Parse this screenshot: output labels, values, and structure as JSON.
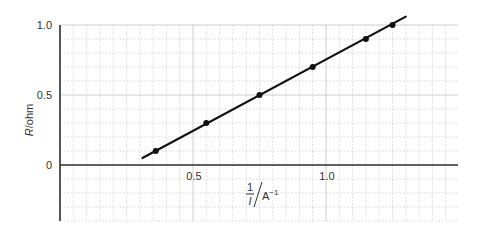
{
  "chart_data": {
    "type": "line",
    "title": "",
    "xlabel": "1/I / A^-1",
    "ylabel": "R/ohm",
    "xlabel_parts": {
      "numerator": "1",
      "denominator": "I",
      "unit": "A",
      "unit_exp": "−1"
    },
    "ylabel_parts": {
      "symbol": "R",
      "unit": "/ohm"
    },
    "xlim": [
      0,
      1.5
    ],
    "ylim": [
      -0.4,
      1.0
    ],
    "x_ticks": [
      {
        "value": 0.5,
        "label": "0.5"
      },
      {
        "value": 1.0,
        "label": "1.0"
      }
    ],
    "y_ticks": [
      {
        "value": 0,
        "label": "0"
      },
      {
        "value": 0.5,
        "label": "0.5"
      },
      {
        "value": 1.0,
        "label": "1.0"
      }
    ],
    "grid": {
      "on": true,
      "x_minor": 0.05,
      "y_minor": 0.1
    },
    "series": [
      {
        "name": "measured points",
        "marker": "dot",
        "x": [
          0.36,
          0.55,
          0.75,
          0.95,
          1.15,
          1.25
        ],
        "values": [
          0.1,
          0.3,
          0.5,
          0.7,
          0.9,
          1.0
        ]
      }
    ],
    "fit_line": {
      "x": [
        0.31,
        1.3
      ],
      "values": [
        0.05,
        1.06
      ]
    },
    "legend": null
  },
  "colors": {
    "grid": "#c8c8c8",
    "axis": "#333333",
    "line": "#111111"
  }
}
